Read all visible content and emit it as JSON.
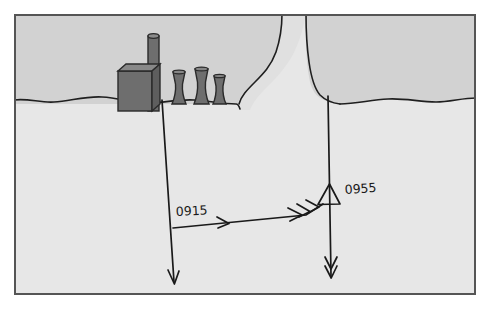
{
  "figure": {
    "kind": "nautical-chart-plot",
    "background_color": "#ffffff",
    "frame": {
      "border_color": "#555555",
      "border_width": 2,
      "x": 14,
      "y": 14,
      "width": 462,
      "height": 281
    }
  },
  "palette": {
    "land": "#d2d2d2",
    "water": "#e6e6e6",
    "inlet": "#dcdcdc",
    "structure_fill": "#6e6e6e",
    "structure_top": "#848484",
    "structure_outline": "#2a2a2a",
    "ink": "#1a1a1a",
    "shore_line": "#1f1f1f",
    "frame_border": "#555555"
  },
  "terrain": {
    "land_label": "land",
    "water_label": "water",
    "shoreline_label": "shoreline",
    "inlet_label": "inlet-channel"
  },
  "landmarks": [
    {
      "name": "factory-building",
      "type": "building",
      "x": 118,
      "y": 64,
      "width": 36,
      "height": 33
    },
    {
      "name": "smokestack",
      "type": "chimney",
      "x": 148,
      "y": 31,
      "width": 11,
      "height": 66
    },
    {
      "name": "cooling-tower-1",
      "type": "cooling-tower",
      "x": 172,
      "y": 71,
      "width": 16,
      "height": 26
    },
    {
      "name": "cooling-tower-2",
      "type": "cooling-tower",
      "x": 194,
      "y": 69,
      "width": 16,
      "height": 28
    },
    {
      "name": "cooling-tower-3",
      "type": "cooling-tower",
      "x": 213,
      "y": 75,
      "width": 13,
      "height": 22
    }
  ],
  "plot": {
    "lines": [
      {
        "name": "bearing-line-0915",
        "label": "0915",
        "label_x": 176,
        "label_y": 213,
        "arrowheads": 1,
        "from": {
          "x": 163,
          "y": 100
        },
        "to": {
          "x": 175,
          "y": 285
        }
      },
      {
        "name": "bearing-line-0955",
        "label": "0955",
        "label_x": 345,
        "label_y": 193,
        "arrowheads": 2,
        "from": {
          "x": 329,
          "y": 96
        },
        "to": {
          "x": 331,
          "y": 280
        }
      },
      {
        "name": "course-vector",
        "label": "",
        "arrowheads": 3,
        "from": {
          "x": 173,
          "y": 228
        },
        "to": {
          "x": 322,
          "y": 205
        }
      }
    ],
    "symbols": [
      {
        "name": "fix-triangle",
        "type": "triangle",
        "meaning": "fix",
        "x": 322,
        "y": 195,
        "size": 20
      }
    ],
    "time_labels": [
      "0915",
      "0955"
    ]
  }
}
